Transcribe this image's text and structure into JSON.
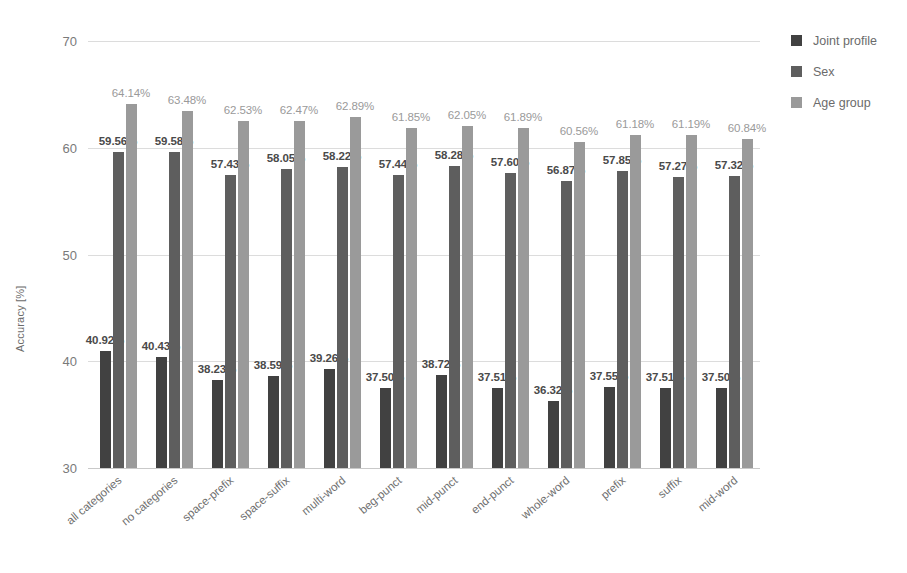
{
  "chart_data": {
    "type": "bar",
    "title": "",
    "xlabel": "",
    "ylabel": "Accuracy [%]",
    "ylim": [
      30,
      70
    ],
    "yticks": [
      30,
      40,
      50,
      60,
      70
    ],
    "grid": true,
    "legend_position": "right",
    "value_label_suffix": "%",
    "categories": [
      "all categories",
      "no categories",
      "space-prefix",
      "space-suffix",
      "multi-word",
      "beg-punct",
      "mid-punct",
      "end-punct",
      "whole-word",
      "prefix",
      "suffix",
      "mid-word"
    ],
    "series": [
      {
        "name": "Joint profile",
        "color": "#414141",
        "values": [
          40.92,
          40.43,
          38.23,
          38.59,
          39.26,
          37.5,
          38.72,
          37.51,
          36.32,
          37.55,
          37.51,
          37.5
        ],
        "labels": [
          "40.92%",
          "40.43%",
          "38.23%",
          "38.59%",
          "39.26%",
          "37.50%",
          "38.72%",
          "37.51%",
          "36.32%",
          "37.55%",
          "37.51%",
          "37.50%"
        ]
      },
      {
        "name": "Sex",
        "color": "#5e5e5e",
        "values": [
          59.56,
          59.58,
          57.43,
          58.05,
          58.22,
          57.44,
          58.28,
          57.6,
          56.87,
          57.85,
          57.27,
          57.32
        ],
        "labels": [
          "59.56%",
          "59.58%",
          "57.43%",
          "58.05%",
          "58.22%",
          "57.44%",
          "58.28%",
          "57.60%",
          "56.87%",
          "57.85%",
          "57.27%",
          "57.32%"
        ]
      },
      {
        "name": "Age group",
        "color": "#9a9a9a",
        "values": [
          64.14,
          63.48,
          62.53,
          62.47,
          62.89,
          61.85,
          62.05,
          61.89,
          60.56,
          61.18,
          61.19,
          60.84
        ],
        "labels": [
          "64.14%",
          "63.48%",
          "62.53%",
          "62.47%",
          "62.89%",
          "61.85%",
          "62.05%",
          "61.89%",
          "60.56%",
          "61.18%",
          "61.19%",
          "60.84%"
        ]
      }
    ]
  }
}
